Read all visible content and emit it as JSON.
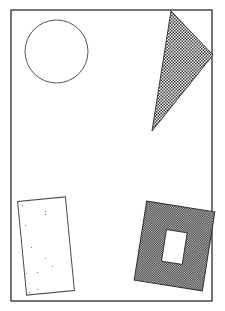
{
  "figure": {
    "title": "Geometric shapes figure",
    "background_color": "#ffffff",
    "width": 225,
    "height": 311,
    "frame": {
      "label": "border-frame",
      "x": 11,
      "y": 10,
      "width": 201,
      "height": 291,
      "stroke_color": "#2b2b2b",
      "stroke_width": 1.3,
      "fill": "none"
    },
    "shapes": [
      {
        "id": "circle",
        "label": "Circle",
        "type": "circle",
        "fill_style": "none",
        "fill_color": "#ffffff",
        "stroke_color": "#555555",
        "stroke_width": 1,
        "center_x": 56.5,
        "center_y": 51.5,
        "radius": 31.5,
        "rotation_deg": 0
      },
      {
        "id": "triangle",
        "label": "Triangle",
        "type": "triangle",
        "fill_style": "checkerboard-light",
        "fill_color": "#7a7a7a",
        "stroke_color": "#3a3a3a",
        "stroke_width": 1,
        "points": "171,11 213,55 152,131",
        "rotation_deg": 0
      },
      {
        "id": "speckled-rectangle",
        "label": "Speckled rectangle",
        "type": "rectangle",
        "fill_style": "noise-speckle",
        "fill_color": "#bdbdbd",
        "stroke_color": "#4a4a4a",
        "stroke_width": 1,
        "x": 22,
        "y": 199,
        "width": 48,
        "height": 94,
        "rotation_deg": -5.5
      },
      {
        "id": "dark-square-with-hole",
        "label": "Dark square with rectangular hole",
        "type": "square-with-hole",
        "fill_style": "checkerboard-dark",
        "fill_color": "#3b3b3b",
        "stroke_color": "#2b2b2b",
        "stroke_width": 1,
        "x": 140,
        "y": 206,
        "width": 69,
        "height": 80,
        "rotation_deg": 9,
        "hole": {
          "label": "hole",
          "x": 164,
          "y": 231,
          "width": 21,
          "height": 32,
          "fill_color": "#ffffff"
        }
      }
    ]
  }
}
